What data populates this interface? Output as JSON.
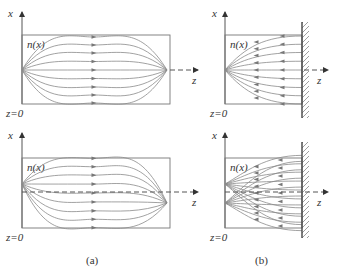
{
  "figure": {
    "panel_a_caption": "(a)",
    "panel_b_caption": "(b)",
    "axis_x_label": "x",
    "axis_z_label": "z",
    "origin_label": "z=0",
    "medium_label": "n(x)"
  },
  "panels": [
    {
      "id": "a-top",
      "type": "graded-index focusing, on-axis source",
      "source_y": 70,
      "focus_y": 70,
      "mirror": false
    },
    {
      "id": "b-top",
      "type": "phase-conjugate mirror, on-axis source",
      "source_y": 70,
      "mirror": true
    },
    {
      "id": "a-bottom",
      "type": "graded-index focusing, off-axis source",
      "source_y": 184,
      "focus_y": 203,
      "mirror": false
    },
    {
      "id": "b-bottom",
      "type": "phase-conjugate mirror, off-axis sources",
      "source_y": [
        184,
        203
      ],
      "mirror": true
    }
  ],
  "colors": {
    "ray": "#8a8a8a",
    "box": "#777777",
    "axis": "#555555",
    "text": "#333333"
  }
}
